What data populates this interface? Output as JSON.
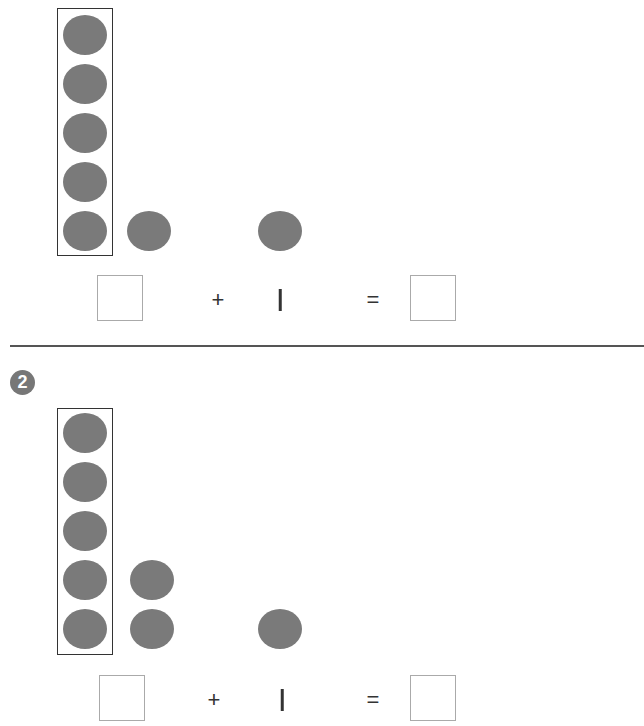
{
  "problems": [
    {
      "number": "",
      "five_frame_count": 5,
      "extra_column_count": 1,
      "separate_count": 1,
      "equation": {
        "left_box": "",
        "operator": "+",
        "addend": "1",
        "equals": "=",
        "result_box": ""
      }
    },
    {
      "number": "2",
      "five_frame_count": 5,
      "extra_column_count": 2,
      "separate_count": 1,
      "equation": {
        "left_box": "",
        "operator": "+",
        "addend": "1",
        "equals": "=",
        "result_box": ""
      }
    }
  ],
  "colors": {
    "dot": "#7a7a7a",
    "badge": "#777777",
    "frame": "#333333",
    "answer_box_border": "#aaaaaa"
  }
}
